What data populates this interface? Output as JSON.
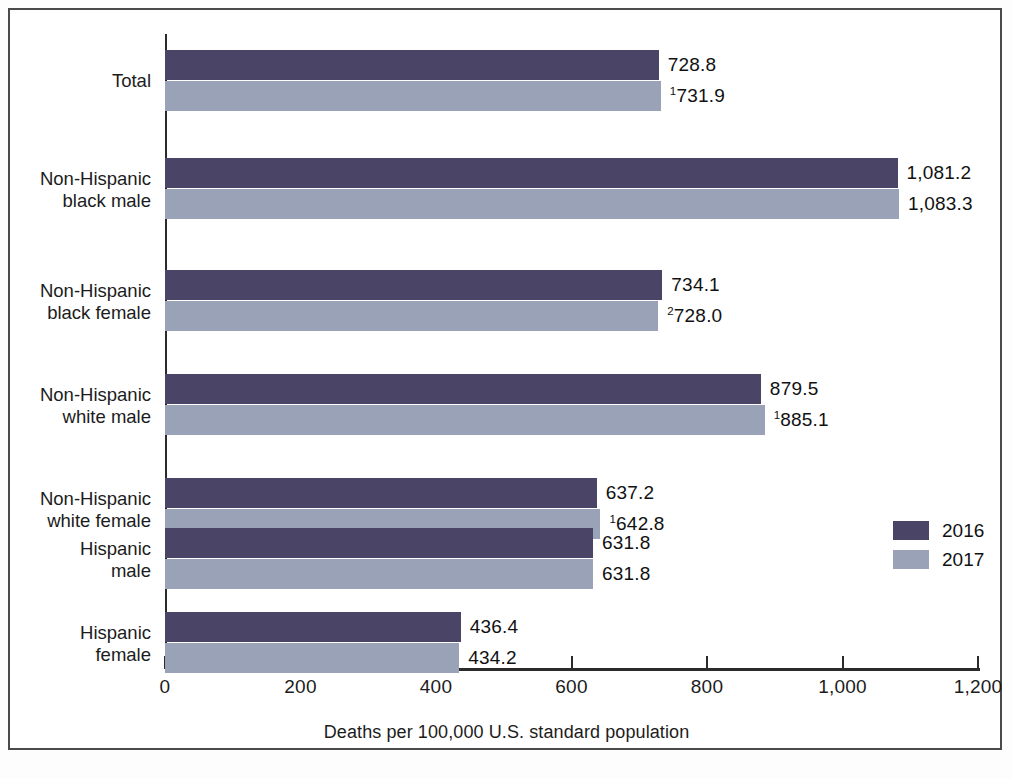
{
  "chart_data": {
    "type": "bar",
    "orientation": "horizontal",
    "title": "",
    "xlabel": "Deaths per 100,000 U.S. standard population",
    "ylabel": "",
    "xlim": [
      0,
      1200
    ],
    "xticks": [
      0,
      200,
      400,
      600,
      800,
      1000,
      1200
    ],
    "xtick_labels": [
      "0",
      "200",
      "400",
      "600",
      "800",
      "1,000",
      "1,200"
    ],
    "grid": false,
    "legend_position": "right-middle",
    "categories": [
      "Total",
      "Non-Hispanic black male",
      "Non-Hispanic black female",
      "Non-Hispanic white male",
      "Non-Hispanic white female",
      "Hispanic male",
      "Hispanic female"
    ],
    "category_lines": [
      [
        "Total"
      ],
      [
        "Non-Hispanic",
        "black male"
      ],
      [
        "Non-Hispanic",
        "black female"
      ],
      [
        "Non-Hispanic",
        "white male"
      ],
      [
        "Non-Hispanic",
        "white female"
      ],
      [
        "Hispanic",
        "male"
      ],
      [
        "Hispanic",
        "female"
      ]
    ],
    "series": [
      {
        "name": "2016",
        "color": "#4a4566",
        "values": [
          728.8,
          1081.2,
          734.1,
          879.5,
          637.2,
          631.8,
          436.4
        ],
        "value_labels": [
          "728.8",
          "1,081.2",
          "734.1",
          "879.5",
          "637.2",
          "631.8",
          "436.4"
        ],
        "value_label_superscripts": [
          "",
          "",
          "",
          "",
          "",
          "",
          ""
        ]
      },
      {
        "name": "2017",
        "color": "#9aa2b8",
        "values": [
          731.9,
          1083.3,
          728.0,
          885.1,
          642.8,
          631.8,
          434.2
        ],
        "value_labels": [
          "731.9",
          "1,083.3",
          "728.0",
          "885.1",
          "642.8",
          "631.8",
          "434.2"
        ],
        "value_label_superscripts": [
          "1",
          "",
          "2",
          "1",
          "1",
          "",
          ""
        ]
      }
    ]
  },
  "legend": {
    "items": [
      {
        "label": "2016",
        "color": "#4a4566"
      },
      {
        "label": "2017",
        "color": "#9aa2b8"
      }
    ]
  },
  "axis": {
    "x_title": "Deaths per 100,000 U.S. standard population"
  },
  "colors": {
    "series_2016": "#4a4566",
    "series_2017": "#9aa2b8",
    "axis": "#2b2b2b",
    "text": "#1c1c1c",
    "frame": "#4a4a4a",
    "background": "#ffffff"
  }
}
